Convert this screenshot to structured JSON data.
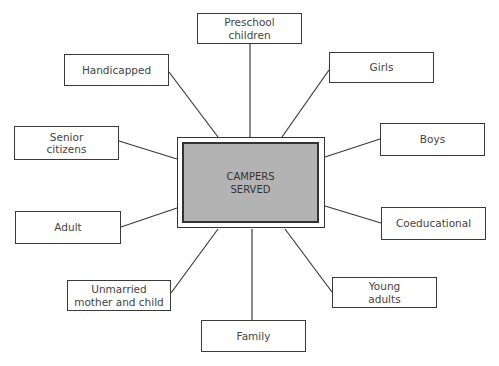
{
  "diagram": {
    "center": {
      "label": "CAMPERS\nSERVED",
      "fill": "#b3b3b3"
    },
    "nodes": [
      {
        "id": "preschool",
        "label": "Preschool\nchildren"
      },
      {
        "id": "handicapped",
        "label": "Handicapped"
      },
      {
        "id": "girls",
        "label": "Girls"
      },
      {
        "id": "senior",
        "label": "Senior\ncitizens"
      },
      {
        "id": "boys",
        "label": "Boys"
      },
      {
        "id": "adult",
        "label": "Adult"
      },
      {
        "id": "coeducational",
        "label": "Coeducational"
      },
      {
        "id": "unmarried",
        "label": "Unmarried\nmother and child"
      },
      {
        "id": "young",
        "label": "Young\nadults"
      },
      {
        "id": "family",
        "label": "Family"
      }
    ],
    "edges": [
      [
        "CAMPERS SERVED",
        "Preschool children"
      ],
      [
        "CAMPERS SERVED",
        "Handicapped"
      ],
      [
        "CAMPERS SERVED",
        "Girls"
      ],
      [
        "CAMPERS SERVED",
        "Senior citizens"
      ],
      [
        "CAMPERS SERVED",
        "Boys"
      ],
      [
        "CAMPERS SERVED",
        "Adult"
      ],
      [
        "CAMPERS SERVED",
        "Coeducational"
      ],
      [
        "CAMPERS SERVED",
        "Unmarried mother and child"
      ],
      [
        "CAMPERS SERVED",
        "Young adults"
      ],
      [
        "CAMPERS SERVED",
        "Family"
      ]
    ]
  }
}
